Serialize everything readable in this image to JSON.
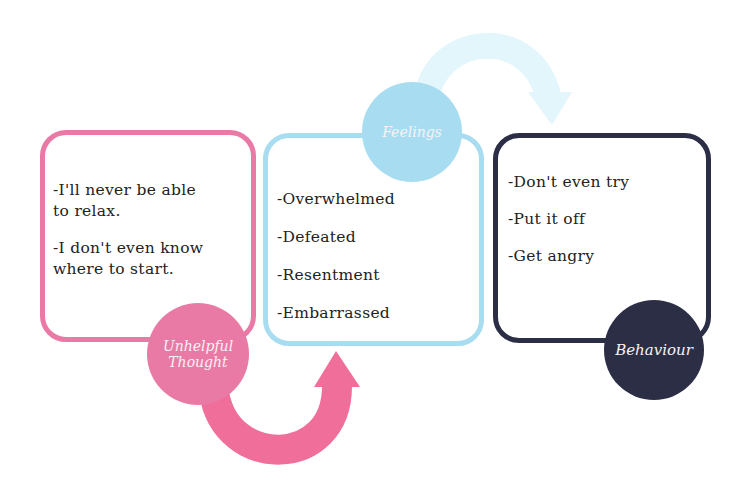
{
  "colors": {
    "thought": "#e97aa5",
    "feelings": "#a8ddf1",
    "behaviour": "#2c2e45",
    "arrow_top": "#e3f6fc",
    "text": "#222222"
  },
  "thought": {
    "label_line1": "Unhelpful",
    "label_line2": "Thought",
    "items": [
      "-I'll never be able",
      "to relax.",
      "-I don't even know",
      "where to start."
    ]
  },
  "feelings": {
    "label": "Feelings",
    "items": [
      "-Overwhelmed",
      "-Defeated",
      "-Resentment",
      "-Embarrassed"
    ]
  },
  "behaviour": {
    "label": "Behaviour",
    "items": [
      "-Don't even try",
      "-Put it off",
      "-Get angry"
    ]
  }
}
